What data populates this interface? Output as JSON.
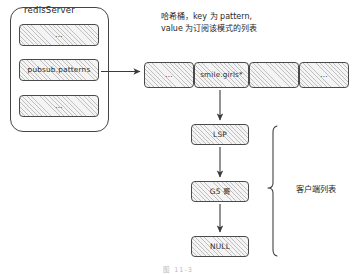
{
  "figure": {
    "caption": "图 11-3",
    "background_color": "#ffffff",
    "stroke_color": "#454545",
    "fill_color": "#f4f4f4"
  },
  "server": {
    "title": "redisServer",
    "slots": [
      {
        "label": "..."
      },
      {
        "label": "pubsub.patterns"
      },
      {
        "label": "..."
      }
    ]
  },
  "annotations": {
    "hash_bucket": "哈希桶，key 为 pattern,\nvalue 为订阅该模式的列表",
    "hash_bucket_line1": "哈希桶，key 为 pattern,",
    "hash_bucket_line2": "value 为订阅该模式的列表",
    "client_list": "客户端列表"
  },
  "hash_bucket": {
    "cells": [
      {
        "label": "..."
      },
      {
        "label": "smile.girls*"
      },
      {
        "label": ""
      },
      {
        "label": "..."
      }
    ]
  },
  "client_list": {
    "nodes": [
      {
        "label": "LSP"
      },
      {
        "label": "G5 哥"
      },
      {
        "label": "NULL"
      }
    ]
  }
}
